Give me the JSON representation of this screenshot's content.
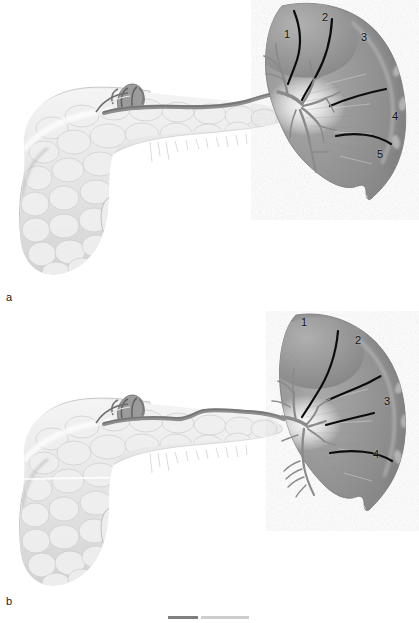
{
  "figure": {
    "background_color": "#ffffff",
    "style": "grayscale pencil/airbrush medical illustration",
    "width": 419,
    "height": 623,
    "caption_fragment": ""
  },
  "panels": [
    {
      "id": "a",
      "label": "a",
      "description": "Distributed type splenic arterial branching; spleen divided into five vascular segments by demarcation lines.",
      "segment_count": 5,
      "branching_pattern": "distributed",
      "segment_numbers": [
        {
          "label": "1",
          "x": 284,
          "y": 29
        },
        {
          "label": "2",
          "x": 322,
          "y": 12
        },
        {
          "label": "3",
          "x": 361,
          "y": 32
        },
        {
          "label": "4",
          "x": 392,
          "y": 111
        },
        {
          "label": "5",
          "x": 377,
          "y": 149
        }
      ],
      "structures": [
        "spleen",
        "splenic artery",
        "splenic hilar branches",
        "pancreas body and tail",
        "pancreatic head",
        "duodenum",
        "celiac trunk stump"
      ]
    },
    {
      "id": "b",
      "label": "b",
      "description": "Magistral type splenic arterial branching; spleen divided into four vascular segments by demarcation lines.",
      "segment_count": 4,
      "branching_pattern": "magistral",
      "segment_numbers": [
        {
          "label": "1",
          "x": 301,
          "y": 317
        },
        {
          "label": "2",
          "x": 355,
          "y": 335
        },
        {
          "label": "3",
          "x": 384,
          "y": 396
        },
        {
          "label": "4",
          "x": 373,
          "y": 449
        }
      ],
      "structures": [
        "spleen",
        "splenic artery",
        "splenic hilar branches",
        "pancreas body and tail",
        "pancreatic head",
        "duodenum",
        "celiac trunk stump"
      ]
    }
  ],
  "colors": {
    "background": "#ffffff",
    "spleen_mid": "#9b9b9b",
    "spleen_dark": "#7d7d7d",
    "spleen_light": "#c2c2c2",
    "spleen_highlight": "#f2f2f2",
    "pancreas_base": "#e9e9e9",
    "pancreas_shadow": "#c9c9c9",
    "vessel": "#8a8a8a",
    "vessel_dark": "#6b6b6b",
    "demarcation_line": "#0c0c0c",
    "text": "#101010"
  }
}
